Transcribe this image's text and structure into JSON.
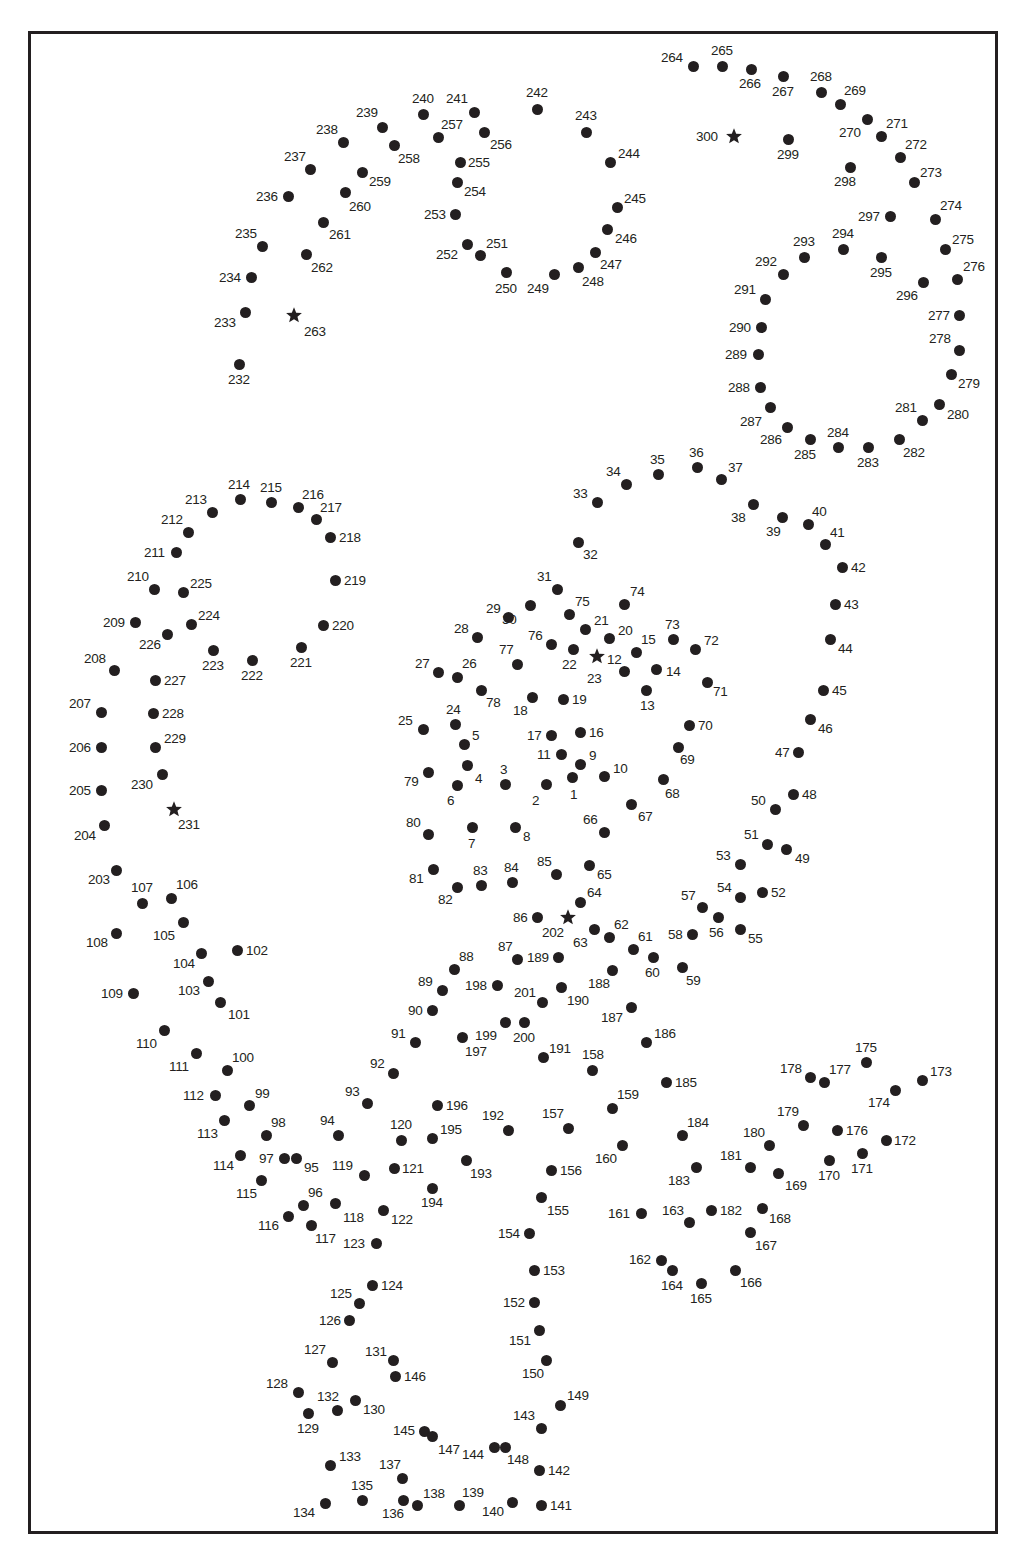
{
  "puzzle": {
    "type": "connect-the-dots",
    "total_points": 300,
    "start_markers": [
      12,
      202,
      231,
      263,
      300
    ],
    "colors": {
      "ink": "#231f20",
      "background": "#ffffff"
    }
  },
  "points": [
    [
      1,
      572,
      777,
      -2,
      18
    ],
    [
      2,
      546,
      784,
      -14,
      17
    ],
    [
      3,
      505,
      784,
      -5,
      -14
    ],
    [
      4,
      467,
      765,
      8,
      14
    ],
    [
      5,
      464,
      744,
      8,
      -8
    ],
    [
      6,
      457,
      785,
      -10,
      16
    ],
    [
      7,
      472,
      827,
      -4,
      17
    ],
    [
      8,
      515,
      827,
      8,
      10
    ],
    [
      9,
      580,
      764,
      9,
      -8
    ],
    [
      10,
      604,
      776,
      9,
      -7
    ],
    [
      11,
      561,
      754,
      -24,
      1
    ],
    [
      12,
      597,
      656,
      10,
      4
    ],
    [
      13,
      646,
      690,
      -6,
      16
    ],
    [
      14,
      656,
      669,
      10,
      3
    ],
    [
      15,
      636,
      652,
      5,
      -12
    ],
    [
      16,
      580,
      732,
      9,
      1
    ],
    [
      17,
      551,
      735,
      -24,
      1
    ],
    [
      18,
      532,
      697,
      -19,
      14
    ],
    [
      19,
      563,
      699,
      9,
      1
    ],
    [
      20,
      609,
      638,
      9,
      -7
    ],
    [
      21,
      585,
      629,
      9,
      -8
    ],
    [
      22,
      573,
      649,
      -11,
      16
    ],
    [
      23,
      624,
      671,
      -37,
      8
    ],
    [
      24,
      455,
      724,
      -9,
      -14
    ],
    [
      25,
      423,
      729,
      -25,
      -8
    ],
    [
      26,
      457,
      677,
      5,
      -13
    ],
    [
      27,
      438,
      672,
      -23,
      -8
    ],
    [
      28,
      477,
      637,
      -23,
      -8
    ],
    [
      29,
      508,
      617,
      -22,
      -8
    ],
    [
      30,
      530,
      605,
      -28,
      15
    ],
    [
      31,
      557,
      589,
      -20,
      -12
    ],
    [
      32,
      578,
      542,
      5,
      13
    ],
    [
      33,
      597,
      502,
      -24,
      -8
    ],
    [
      34,
      626,
      484,
      -20,
      -12
    ],
    [
      35,
      658,
      474,
      -8,
      -14
    ],
    [
      36,
      697,
      467,
      -8,
      -14
    ],
    [
      37,
      721,
      479,
      7,
      -11
    ],
    [
      38,
      753,
      504,
      -22,
      14
    ],
    [
      39,
      782,
      517,
      -16,
      15
    ],
    [
      40,
      808,
      524,
      4,
      -12
    ],
    [
      41,
      825,
      544,
      5,
      -11
    ],
    [
      42,
      842,
      567,
      9,
      1
    ],
    [
      43,
      835,
      604,
      9,
      1
    ],
    [
      44,
      830,
      639,
      8,
      10
    ],
    [
      45,
      823,
      690,
      9,
      1
    ],
    [
      46,
      810,
      719,
      8,
      10
    ],
    [
      47,
      798,
      752,
      -23,
      1
    ],
    [
      48,
      793,
      794,
      9,
      1
    ],
    [
      49,
      786,
      849,
      9,
      10
    ],
    [
      50,
      775,
      809,
      -24,
      -8
    ],
    [
      51,
      767,
      844,
      -23,
      -9
    ],
    [
      52,
      762,
      892,
      9,
      1
    ],
    [
      53,
      740,
      864,
      -24,
      -8
    ],
    [
      54,
      740,
      897,
      -23,
      -9
    ],
    [
      55,
      740,
      929,
      8,
      10
    ],
    [
      56,
      718,
      917,
      -9,
      16
    ],
    [
      57,
      702,
      907,
      -21,
      -11
    ],
    [
      58,
      692,
      934,
      -24,
      1
    ],
    [
      59,
      682,
      967,
      4,
      14
    ],
    [
      60,
      653,
      957,
      -8,
      16
    ],
    [
      61,
      633,
      949,
      5,
      -12
    ],
    [
      62,
      609,
      937,
      5,
      -12
    ],
    [
      63,
      594,
      929,
      -21,
      14
    ],
    [
      64,
      580,
      902,
      7,
      -9
    ],
    [
      65,
      589,
      865,
      8,
      10
    ],
    [
      66,
      604,
      832,
      -21,
      -12
    ],
    [
      67,
      631,
      804,
      7,
      13
    ],
    [
      68,
      663,
      779,
      2,
      15
    ],
    [
      69,
      678,
      747,
      2,
      13
    ],
    [
      70,
      689,
      725,
      9,
      1
    ],
    [
      71,
      707,
      682,
      6,
      10
    ],
    [
      72,
      695,
      649,
      9,
      -8
    ],
    [
      73,
      673,
      639,
      -8,
      -14
    ],
    [
      74,
      624,
      604,
      6,
      -12
    ],
    [
      75,
      569,
      614,
      6,
      -12
    ],
    [
      76,
      551,
      644,
      -23,
      -8
    ],
    [
      77,
      517,
      664,
      -18,
      -14
    ],
    [
      78,
      481,
      690,
      5,
      13
    ],
    [
      79,
      428,
      772,
      -24,
      10
    ],
    [
      80,
      428,
      834,
      -22,
      -11
    ],
    [
      81,
      433,
      869,
      -24,
      10
    ],
    [
      82,
      457,
      887,
      -19,
      13
    ],
    [
      83,
      481,
      885,
      -8,
      -14
    ],
    [
      84,
      512,
      882,
      -8,
      -14
    ],
    [
      85,
      556,
      874,
      -19,
      -12
    ],
    [
      86,
      537,
      917,
      -24,
      1
    ],
    [
      87,
      517,
      959,
      -19,
      -12
    ],
    [
      88,
      454,
      969,
      5,
      -12
    ],
    [
      89,
      442,
      990,
      -24,
      -8
    ],
    [
      90,
      432,
      1010,
      -24,
      1
    ],
    [
      91,
      415,
      1042,
      -24,
      -8
    ],
    [
      92,
      393,
      1073,
      -23,
      -9
    ],
    [
      93,
      367,
      1103,
      -22,
      -11
    ],
    [
      94,
      338,
      1135,
      -18,
      -14
    ],
    [
      95,
      296,
      1158,
      8,
      10
    ],
    [
      96,
      303,
      1205,
      5,
      -12
    ],
    [
      97,
      284,
      1158,
      -25,
      1
    ],
    [
      98,
      266,
      1135,
      5,
      -12
    ],
    [
      99,
      249,
      1105,
      6,
      -11
    ],
    [
      100,
      227,
      1070,
      5,
      -12
    ],
    [
      101,
      220,
      1002,
      8,
      13
    ],
    [
      102,
      237,
      950,
      9,
      1
    ],
    [
      103,
      208,
      981,
      -30,
      10
    ],
    [
      104,
      201,
      953,
      -28,
      11
    ],
    [
      105,
      183,
      922,
      -30,
      14
    ],
    [
      106,
      171,
      898,
      5,
      -13
    ],
    [
      107,
      142,
      903,
      -11,
      -15
    ],
    [
      108,
      116,
      933,
      -30,
      10
    ],
    [
      109,
      133,
      993,
      -32,
      1
    ],
    [
      110,
      164,
      1030,
      -28,
      14
    ],
    [
      111,
      196,
      1053,
      -27,
      14
    ],
    [
      112,
      215,
      1095,
      -32,
      1
    ],
    [
      113,
      224,
      1120,
      -27,
      14
    ],
    [
      114,
      240,
      1155,
      -27,
      11
    ],
    [
      115,
      261,
      1180,
      -25,
      14
    ],
    [
      116,
      288,
      1216,
      -30,
      10
    ],
    [
      117,
      311,
      1225,
      4,
      14
    ],
    [
      118,
      335,
      1203,
      8,
      15
    ],
    [
      119,
      364,
      1175,
      -32,
      -9
    ],
    [
      120,
      401,
      1140,
      -11,
      -15
    ],
    [
      121,
      394,
      1168,
      8,
      1
    ],
    [
      122,
      383,
      1210,
      8,
      10
    ],
    [
      123,
      376,
      1243,
      -33,
      1
    ],
    [
      124,
      372,
      1285,
      9,
      1
    ],
    [
      125,
      359,
      1303,
      -29,
      -9
    ],
    [
      126,
      349,
      1320,
      -30,
      1
    ],
    [
      127,
      332,
      1362,
      -28,
      -12
    ],
    [
      128,
      298,
      1392,
      -32,
      -8
    ],
    [
      129,
      308,
      1413,
      -11,
      16
    ],
    [
      130,
      355,
      1400,
      8,
      10
    ],
    [
      131,
      393,
      1360,
      -28,
      -8
    ],
    [
      132,
      337,
      1410,
      -20,
      -13
    ],
    [
      133,
      330,
      1465,
      9,
      -8
    ],
    [
      134,
      325,
      1503,
      -32,
      10
    ],
    [
      135,
      362,
      1500,
      -11,
      -14
    ],
    [
      136,
      403,
      1500,
      -21,
      14
    ],
    [
      137,
      402,
      1478,
      -23,
      -13
    ],
    [
      138,
      417,
      1505,
      6,
      -11
    ],
    [
      139,
      459,
      1505,
      3,
      -12
    ],
    [
      140,
      512,
      1502,
      -30,
      10
    ],
    [
      141,
      541,
      1505,
      9,
      1
    ],
    [
      142,
      539,
      1470,
      9,
      1
    ],
    [
      143,
      541,
      1428,
      -28,
      -12
    ],
    [
      144,
      494,
      1447,
      -32,
      8
    ],
    [
      145,
      424,
      1431,
      -31,
      0
    ],
    [
      146,
      395,
      1376,
      9,
      1
    ],
    [
      147,
      432,
      1436,
      6,
      14
    ],
    [
      148,
      505,
      1447,
      2,
      13
    ],
    [
      149,
      560,
      1405,
      7,
      -9
    ],
    [
      150,
      546,
      1360,
      -24,
      14
    ],
    [
      151,
      539,
      1330,
      -30,
      11
    ],
    [
      152,
      534,
      1302,
      -31,
      1
    ],
    [
      153,
      534,
      1270,
      9,
      1
    ],
    [
      154,
      529,
      1233,
      -31,
      1
    ],
    [
      155,
      541,
      1197,
      6,
      14
    ],
    [
      156,
      551,
      1170,
      9,
      1
    ],
    [
      157,
      568,
      1128,
      -26,
      -14
    ],
    [
      158,
      592,
      1070,
      -10,
      -15
    ],
    [
      159,
      612,
      1108,
      5,
      -13
    ],
    [
      160,
      622,
      1145,
      -27,
      14
    ],
    [
      161,
      641,
      1213,
      -33,
      1
    ],
    [
      162,
      661,
      1260,
      -32,
      0
    ],
    [
      163,
      689,
      1222,
      -27,
      -11
    ],
    [
      164,
      672,
      1270,
      -11,
      16
    ],
    [
      165,
      701,
      1283,
      -11,
      16
    ],
    [
      166,
      735,
      1270,
      5,
      13
    ],
    [
      167,
      750,
      1232,
      5,
      14
    ],
    [
      168,
      762,
      1208,
      7,
      11
    ],
    [
      169,
      778,
      1173,
      7,
      13
    ],
    [
      170,
      829,
      1160,
      -11,
      16
    ],
    [
      171,
      862,
      1153,
      -11,
      16
    ],
    [
      172,
      886,
      1140,
      8,
      1
    ],
    [
      173,
      922,
      1080,
      8,
      -8
    ],
    [
      174,
      895,
      1090,
      -27,
      13
    ],
    [
      175,
      866,
      1062,
      -11,
      -14
    ],
    [
      176,
      837,
      1130,
      9,
      1
    ],
    [
      177,
      824,
      1082,
      5,
      -12
    ],
    [
      178,
      810,
      1077,
      -30,
      -8
    ],
    [
      179,
      803,
      1125,
      -26,
      -13
    ],
    [
      180,
      769,
      1145,
      -26,
      -12
    ],
    [
      181,
      750,
      1167,
      -30,
      -11
    ],
    [
      182,
      711,
      1210,
      9,
      1
    ],
    [
      183,
      696,
      1167,
      -28,
      14
    ],
    [
      184,
      682,
      1135,
      5,
      -12
    ],
    [
      185,
      666,
      1082,
      9,
      1
    ],
    [
      186,
      646,
      1042,
      8,
      -8
    ],
    [
      187,
      631,
      1007,
      -30,
      11
    ],
    [
      188,
      612,
      970,
      -24,
      14
    ],
    [
      189,
      558,
      957,
      -31,
      1
    ],
    [
      190,
      561,
      987,
      6,
      14
    ],
    [
      191,
      543,
      1057,
      6,
      -8
    ],
    [
      192,
      508,
      1130,
      -26,
      -14
    ],
    [
      193,
      466,
      1160,
      4,
      14
    ],
    [
      194,
      432,
      1188,
      -11,
      15
    ],
    [
      195,
      432,
      1138,
      8,
      -8
    ],
    [
      196,
      437,
      1105,
      9,
      1
    ],
    [
      197,
      462,
      1037,
      3,
      15
    ],
    [
      198,
      497,
      985,
      -32,
      1
    ],
    [
      199,
      505,
      1022,
      -30,
      14
    ],
    [
      200,
      524,
      1022,
      -11,
      16
    ],
    [
      201,
      542,
      1002,
      -28,
      -9
    ],
    [
      202,
      568,
      917,
      -26,
      16
    ],
    [
      203,
      116,
      870,
      -28,
      10
    ],
    [
      204,
      104,
      825,
      -30,
      11
    ],
    [
      205,
      101,
      790,
      -32,
      1
    ],
    [
      206,
      101,
      747,
      -32,
      1
    ],
    [
      207,
      101,
      712,
      -32,
      -8
    ],
    [
      208,
      114,
      670,
      -30,
      -11
    ],
    [
      209,
      135,
      622,
      -32,
      1
    ],
    [
      210,
      154,
      589,
      -27,
      -12
    ],
    [
      211,
      176,
      552,
      -32,
      1
    ],
    [
      212,
      188,
      532,
      -27,
      -12
    ],
    [
      213,
      212,
      512,
      -27,
      -12
    ],
    [
      214,
      240,
      499,
      -12,
      -14
    ],
    [
      215,
      271,
      502,
      -11,
      -14
    ],
    [
      216,
      298,
      507,
      4,
      -12
    ],
    [
      217,
      316,
      519,
      4,
      -11
    ],
    [
      218,
      330,
      537,
      9,
      1
    ],
    [
      219,
      335,
      580,
      9,
      1
    ],
    [
      220,
      323,
      625,
      9,
      1
    ],
    [
      221,
      301,
      647,
      -11,
      16
    ],
    [
      222,
      252,
      660,
      -11,
      16
    ],
    [
      223,
      213,
      650,
      -11,
      16
    ],
    [
      224,
      191,
      624,
      7,
      -8
    ],
    [
      225,
      183,
      592,
      7,
      -8
    ],
    [
      226,
      167,
      634,
      -28,
      11
    ],
    [
      227,
      155,
      680,
      9,
      1
    ],
    [
      228,
      153,
      713,
      9,
      1
    ],
    [
      229,
      155,
      747,
      9,
      -8
    ],
    [
      230,
      162,
      774,
      -31,
      11
    ],
    [
      231,
      174,
      809,
      4,
      16
    ],
    [
      232,
      239,
      364,
      -11,
      16
    ],
    [
      233,
      245,
      312,
      -31,
      11
    ],
    [
      234,
      251,
      277,
      -32,
      1
    ],
    [
      235,
      262,
      246,
      -27,
      -12
    ],
    [
      236,
      288,
      196,
      -32,
      1
    ],
    [
      237,
      310,
      169,
      -26,
      -12
    ],
    [
      238,
      343,
      142,
      -27,
      -12
    ],
    [
      239,
      382,
      127,
      -26,
      -14
    ],
    [
      240,
      423,
      114,
      -11,
      -15
    ],
    [
      241,
      474,
      112,
      -28,
      -13
    ],
    [
      242,
      537,
      109,
      -11,
      -16
    ],
    [
      243,
      586,
      132,
      -11,
      -16
    ],
    [
      244,
      610,
      162,
      8,
      -8
    ],
    [
      245,
      617,
      207,
      7,
      -8
    ],
    [
      246,
      607,
      229,
      8,
      10
    ],
    [
      247,
      595,
      252,
      5,
      13
    ],
    [
      248,
      578,
      267,
      4,
      15
    ],
    [
      249,
      554,
      274,
      -27,
      15
    ],
    [
      250,
      506,
      272,
      -11,
      17
    ],
    [
      251,
      480,
      255,
      6,
      -11
    ],
    [
      252,
      467,
      244,
      -31,
      11
    ],
    [
      253,
      455,
      214,
      -31,
      1
    ],
    [
      254,
      457,
      182,
      7,
      10
    ],
    [
      255,
      460,
      162,
      8,
      1
    ],
    [
      256,
      484,
      132,
      6,
      13
    ],
    [
      257,
      438,
      137,
      3,
      -12
    ],
    [
      258,
      394,
      145,
      4,
      14
    ],
    [
      259,
      362,
      172,
      7,
      10
    ],
    [
      260,
      345,
      192,
      4,
      15
    ],
    [
      261,
      323,
      222,
      6,
      13
    ],
    [
      262,
      306,
      254,
      5,
      14
    ],
    [
      263,
      294,
      315,
      10,
      17
    ],
    [
      264,
      693,
      66,
      -32,
      -8
    ],
    [
      265,
      722,
      66,
      -11,
      -15
    ],
    [
      266,
      751,
      69,
      -12,
      15
    ],
    [
      267,
      783,
      76,
      -11,
      16
    ],
    [
      268,
      821,
      92,
      -11,
      -15
    ],
    [
      269,
      840,
      104,
      4,
      -13
    ],
    [
      270,
      867,
      119,
      -28,
      14
    ],
    [
      271,
      881,
      136,
      5,
      -12
    ],
    [
      272,
      900,
      157,
      5,
      -12
    ],
    [
      273,
      914,
      182,
      6,
      -9
    ],
    [
      274,
      935,
      219,
      5,
      -13
    ],
    [
      275,
      945,
      249,
      7,
      -9
    ],
    [
      276,
      957,
      279,
      6,
      -12
    ],
    [
      277,
      959,
      315,
      -31,
      1
    ],
    [
      278,
      959,
      350,
      -30,
      -11
    ],
    [
      279,
      951,
      374,
      7,
      10
    ],
    [
      280,
      939,
      404,
      8,
      11
    ],
    [
      281,
      922,
      420,
      -27,
      -12
    ],
    [
      282,
      899,
      439,
      4,
      14
    ],
    [
      283,
      868,
      447,
      -11,
      16
    ],
    [
      284,
      838,
      447,
      -11,
      -14
    ],
    [
      285,
      810,
      439,
      -16,
      16
    ],
    [
      286,
      787,
      427,
      -27,
      13
    ],
    [
      287,
      770,
      407,
      -30,
      15
    ],
    [
      288,
      760,
      387,
      -32,
      1
    ],
    [
      289,
      758,
      354,
      -33,
      1
    ],
    [
      290,
      761,
      327,
      -32,
      1
    ],
    [
      291,
      765,
      299,
      -31,
      -9
    ],
    [
      292,
      783,
      274,
      -28,
      -12
    ],
    [
      293,
      804,
      257,
      -11,
      -15
    ],
    [
      294,
      843,
      249,
      -11,
      -15
    ],
    [
      295,
      881,
      257,
      -11,
      16
    ],
    [
      296,
      923,
      282,
      -27,
      14
    ],
    [
      297,
      890,
      216,
      -32,
      1
    ],
    [
      298,
      850,
      167,
      -16,
      15
    ],
    [
      299,
      788,
      139,
      -11,
      16
    ],
    [
      300,
      734,
      136,
      -38,
      1
    ]
  ]
}
